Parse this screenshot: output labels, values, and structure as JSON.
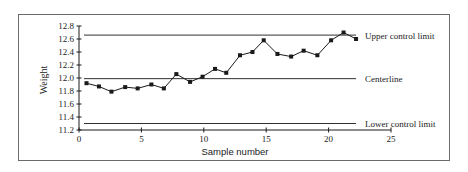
{
  "chart_data": {
    "type": "line",
    "title": "",
    "xlabel": "Sample number",
    "ylabel": "Weight",
    "xlim": [
      0,
      25
    ],
    "ylim": [
      11.2,
      12.8
    ],
    "x_ticks": [
      0,
      5,
      10,
      15,
      20,
      25
    ],
    "x_tick_labels": [
      "0",
      "5",
      "10",
      "15",
      "20",
      "25"
    ],
    "y_ticks": [
      11.2,
      11.4,
      11.6,
      11.8,
      12.0,
      12.2,
      12.4,
      12.6,
      12.8
    ],
    "y_tick_labels": [
      "11.2",
      "11.4",
      "11.6",
      "11.8",
      "12.0",
      "12.2",
      "12.4",
      "12.6",
      "12.8"
    ],
    "grid": false,
    "legend": "none",
    "series": [
      {
        "name": "Sample mean weight",
        "marker": "square",
        "x": [
          0.6,
          1.6,
          2.6,
          3.7,
          4.7,
          5.8,
          6.8,
          7.8,
          8.9,
          9.9,
          10.9,
          11.8,
          12.9,
          13.9,
          14.8,
          15.9,
          17.0,
          18.0,
          19.1,
          20.2,
          21.2,
          22.2
        ],
        "values": [
          11.92,
          11.87,
          11.79,
          11.86,
          11.84,
          11.9,
          11.84,
          12.06,
          11.94,
          12.02,
          12.14,
          12.08,
          12.35,
          12.4,
          12.58,
          12.37,
          12.33,
          12.42,
          12.35,
          12.58,
          12.7,
          12.6
        ]
      }
    ],
    "reference_lines": [
      {
        "name": "Upper control limit",
        "value": 12.66,
        "label": "Upper control limit"
      },
      {
        "name": "Centerline",
        "value": 11.99,
        "label": "Centerline"
      },
      {
        "name": "Lower control limit",
        "value": 11.3,
        "label": "Lower control limit"
      }
    ],
    "reference_line_x_range": [
      0.4,
      22.2
    ]
  },
  "colors": {
    "line": "#1a1a1a",
    "frame": "#6b6b6b",
    "text": "#222222",
    "background": "#ffffff"
  }
}
